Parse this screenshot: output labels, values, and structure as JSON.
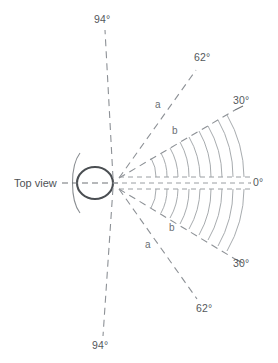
{
  "figure": {
    "title": "Top view",
    "type": "polar-dispersion-diagram",
    "axis_label_zero": "0°",
    "angles": [
      {
        "id": "ray-30-up",
        "label": "30°",
        "value": 30,
        "direction": "up",
        "label_x": 233,
        "label_y": 104
      },
      {
        "id": "ray-62-up",
        "label": "62°",
        "value": 62,
        "direction": "up",
        "label_x": 194,
        "label_y": 61
      },
      {
        "id": "ray-94-up",
        "label": "94°",
        "value": 94,
        "direction": "up",
        "label_x": 94,
        "label_y": 23
      },
      {
        "id": "ray-0",
        "label": "0°",
        "value": 0,
        "direction": "right",
        "label_x": 253,
        "label_y": 186
      },
      {
        "id": "ray-30-down",
        "label": "30°",
        "value": -30,
        "direction": "down",
        "label_x": 233,
        "label_y": 267
      },
      {
        "id": "ray-62-down",
        "label": "62°",
        "value": -62,
        "direction": "down",
        "label_x": 196,
        "label_y": 312
      },
      {
        "id": "ray-94-down",
        "label": "94°",
        "value": -94,
        "direction": "down",
        "label_x": 92,
        "label_y": 349
      }
    ],
    "sector_labels": [
      {
        "id": "sector-a-upper",
        "label": "a",
        "x": 155,
        "y": 108
      },
      {
        "id": "sector-b-upper",
        "label": "b",
        "x": 172,
        "y": 134
      },
      {
        "id": "sector-b-lower",
        "label": "b",
        "x": 169,
        "y": 231
      },
      {
        "id": "sector-a-lower",
        "label": "a",
        "x": 145,
        "y": 248
      }
    ],
    "wavefront_arcs": {
      "count": 9,
      "radii": [
        37,
        48,
        59,
        70,
        81,
        92,
        103,
        114,
        125
      ],
      "span_degrees": 30
    },
    "colors": {
      "line": "#8d9196",
      "arc": "#9da1a5",
      "cone_outline": "#4a4e52",
      "text": "#54585c",
      "background": "#ffffff"
    }
  }
}
